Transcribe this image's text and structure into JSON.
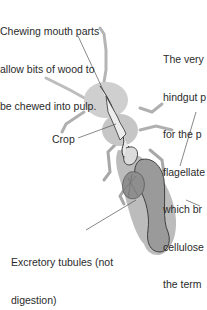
{
  "diagram": {
    "labels": {
      "mouthparts": [
        "Chewing mouth parts",
        "allow bits of wood to",
        "be chewed into pulp."
      ],
      "hindgut": [
        "The very",
        "hindgut p",
        "for the p",
        "flagellate",
        "which br",
        "cellulose",
        "the term"
      ],
      "crop": "Crop",
      "tubules": [
        "Excretory tubules (not",
        "digestion)"
      ]
    },
    "colors": {
      "body": "#c9c9c9",
      "gut_outline": "#333333",
      "foregut": "#e6e6e6",
      "hindgut": "#9a9a9a",
      "leader_line": "#555555"
    }
  }
}
